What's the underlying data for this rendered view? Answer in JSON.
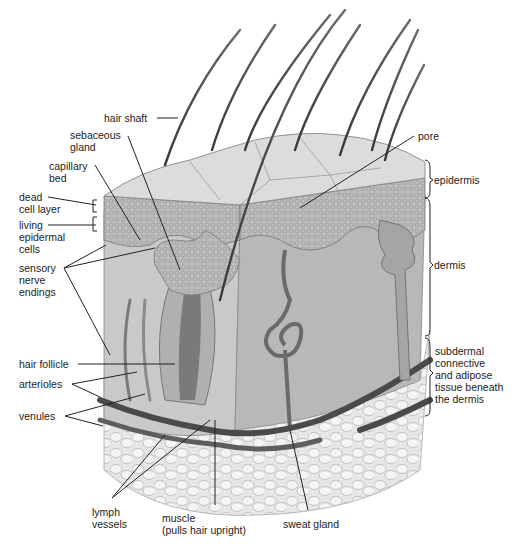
{
  "figure": {
    "labels_left": [
      {
        "id": "hair-shaft",
        "text": "hair shaft"
      },
      {
        "id": "sebaceous-gland",
        "text": "sebaceous\ngland"
      },
      {
        "id": "capillary-bed",
        "text": "capillary\nbed"
      },
      {
        "id": "dead-cell-layer",
        "text": "dead\ncell layer"
      },
      {
        "id": "living-epidermal-cells",
        "text": "living\nepidermal\ncells"
      },
      {
        "id": "sensory-nerve-endings",
        "text": "sensory\nnerve\nendings"
      },
      {
        "id": "hair-follicle",
        "text": "hair follicle"
      },
      {
        "id": "arterioles",
        "text": "arterioles"
      },
      {
        "id": "venules",
        "text": "venules"
      }
    ],
    "labels_bottom": [
      {
        "id": "lymph-vessels",
        "text": "lymph\nvessels"
      },
      {
        "id": "muscle",
        "text": "muscle\n(pulls hair upright)"
      },
      {
        "id": "sweat-gland",
        "text": "sweat gland"
      }
    ],
    "labels_right": [
      {
        "id": "pore",
        "text": "pore"
      },
      {
        "id": "epidermis",
        "text": "epidermis"
      },
      {
        "id": "dermis",
        "text": "dermis"
      },
      {
        "id": "subdermal",
        "text": "subdermal\nconnective\nand adipose\ntissue beneath\nthe dermis"
      }
    ]
  }
}
